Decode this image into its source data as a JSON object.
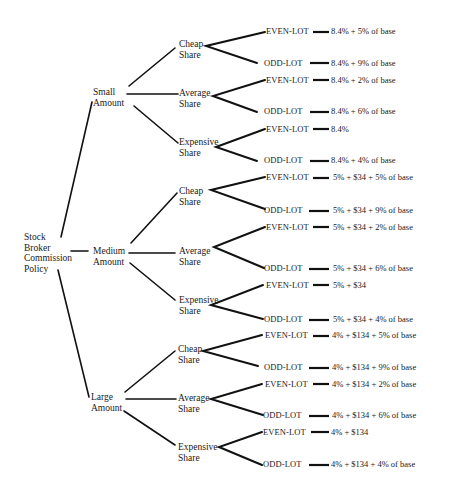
{
  "root": {
    "label": "Stock\nBroker\nCommission\nPolicy"
  },
  "amounts": [
    {
      "label": "Small\nAmount",
      "shares": [
        {
          "label": "Cheap\nShare",
          "even": "8.4% + 5% of base",
          "odd": "8.4% + 9% of base"
        },
        {
          "label": "Average\nShare",
          "even": "8.4% + 2% of base",
          "odd": "8.4% + 6% of base"
        },
        {
          "label": "Expensive\nShare",
          "even": "8.4%",
          "odd": "8.4% + 4% of base"
        }
      ]
    },
    {
      "label": "Medium\nAmount",
      "shares": [
        {
          "label": "Cheap\nShare",
          "even": "5% + $34 + 5% of base",
          "odd": "5% + $34 + 9% of base"
        },
        {
          "label": "Average\nShare",
          "even": "5% + $34 + 2% of base",
          "odd": "5% + $34 + 6% of base"
        },
        {
          "label": "Expensive\nShare",
          "even": "5% + $34",
          "odd": "5% + $34 + 4% of base"
        }
      ]
    },
    {
      "label": "Large\nAmount",
      "shares": [
        {
          "label": "Cheap\nShare",
          "even": "4% + $134 + 5% of base",
          "odd": "4% + $134 + 9% of base"
        },
        {
          "label": "Average\nShare",
          "even": "4% + $134 + 2% of base",
          "odd": "4% + $134 + 6% of base"
        },
        {
          "label": "Expensive\nShare",
          "even": "4% + $134",
          "odd": "4% + $134 + 4% of base"
        }
      ]
    }
  ],
  "leaf_labels": {
    "even": "EVEN-LOT",
    "odd": "ODD-LOT"
  }
}
